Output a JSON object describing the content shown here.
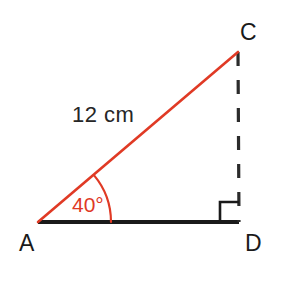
{
  "figure": {
    "type": "right-triangle-diagram",
    "background_color": "#ffffff",
    "colors": {
      "hypotenuse": "#e03a25",
      "angle_arc": "#e03a25",
      "angle_text": "#e03a25",
      "baseline": "#1a1a1a",
      "dashed_side": "#2b2b2b",
      "right_angle_marker": "#1a1a1a",
      "label_text": "#1a1a1a",
      "measure_text": "#262626"
    },
    "vertices": [
      {
        "name": "A",
        "label": "A",
        "x": 38,
        "y": 222,
        "label_x": 19,
        "label_y": 251
      },
      {
        "name": "C",
        "label": "C",
        "x": 238,
        "y": 52,
        "label_x": 240,
        "label_y": 40
      },
      {
        "name": "D",
        "label": "D",
        "x": 239,
        "y": 222,
        "label_x": 245,
        "label_y": 251
      }
    ],
    "sides": [
      {
        "name": "hypotenuse-AC",
        "from": "A",
        "to": "C",
        "style": "solid",
        "color": "#e03a25",
        "width": 2.6,
        "measure_label": "12 cm",
        "label_x": 72,
        "label_y": 122
      },
      {
        "name": "base-AD",
        "from": "A",
        "to": "D",
        "style": "solid",
        "color": "#1a1a1a",
        "width": 4.2,
        "measure_label": ""
      },
      {
        "name": "height-CD",
        "from": "C",
        "to": "D",
        "style": "dashed",
        "color": "#2b2b2b",
        "width": 3.2,
        "dash_pattern": "14 14",
        "measure_label": ""
      }
    ],
    "angles": [
      {
        "name": "angle-at-A",
        "at_vertex": "A",
        "value": 40,
        "unit": "degrees",
        "label": "40°",
        "marker": "arc",
        "arc_radius": 73,
        "label_x": 72,
        "label_y": 212
      },
      {
        "name": "angle-at-D",
        "at_vertex": "D",
        "value": 90,
        "unit": "degrees",
        "label": "",
        "marker": "square",
        "marker_size": 19
      }
    ]
  }
}
